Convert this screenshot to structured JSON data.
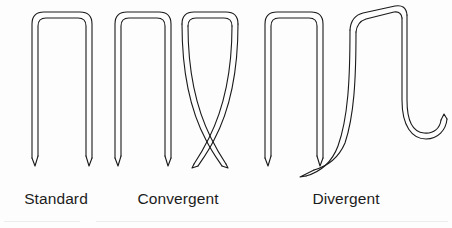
{
  "figure": {
    "kind": "technical-line-illustration",
    "background_color": "#fdfdfd",
    "stroke_color": "#1a1a1a",
    "stroke_width": 1.1,
    "wire_outline_style": "double-line wire outline with rounded crown corners and chisel-cut leg tips"
  },
  "groups": [
    {
      "id": "standard",
      "label_line1": "Standard",
      "label_line2": "point",
      "staple_count": 1,
      "description": "single U-shaped staple with straight parallel legs and chisel points"
    },
    {
      "id": "convergent",
      "label_line1": "Convergent",
      "label_line2": "point",
      "staple_count": 2,
      "description": "straight reference staple beside a staple whose legs curve inward and cross one another in an X"
    },
    {
      "id": "divergent",
      "label_line1": "Divergent",
      "label_line2": "point",
      "staple_count": 2,
      "description": "straight reference staple beside a staple whose legs curve outward, the left leg sweeping away and the right leg curling into an outward hook"
    }
  ],
  "staples": [
    {
      "id": "standard-1",
      "group": "standard",
      "type": "straight",
      "crown_x": 30,
      "crown_y": 10,
      "crown_width": 60,
      "leg_length": 150
    },
    {
      "id": "convergent-1",
      "group": "convergent",
      "type": "straight",
      "crown_x": 113,
      "crown_y": 10,
      "crown_width": 57,
      "leg_length": 150
    },
    {
      "id": "convergent-2",
      "group": "convergent",
      "type": "converging",
      "crown_x": 180,
      "crown_y": 10,
      "crown_width": 58,
      "leg_length": 155
    },
    {
      "id": "divergent-1",
      "group": "divergent",
      "type": "straight",
      "crown_x": 263,
      "crown_y": 10,
      "crown_width": 60,
      "leg_length": 152
    },
    {
      "id": "divergent-2",
      "group": "divergent",
      "type": "diverging",
      "crown_x": 348,
      "crown_y": 8,
      "crown_width": 56,
      "leg_length": 155
    }
  ],
  "rules": [
    {
      "id": "bottom-left",
      "color": "#ececec"
    },
    {
      "id": "bottom-right",
      "color": "#ececec"
    }
  ]
}
